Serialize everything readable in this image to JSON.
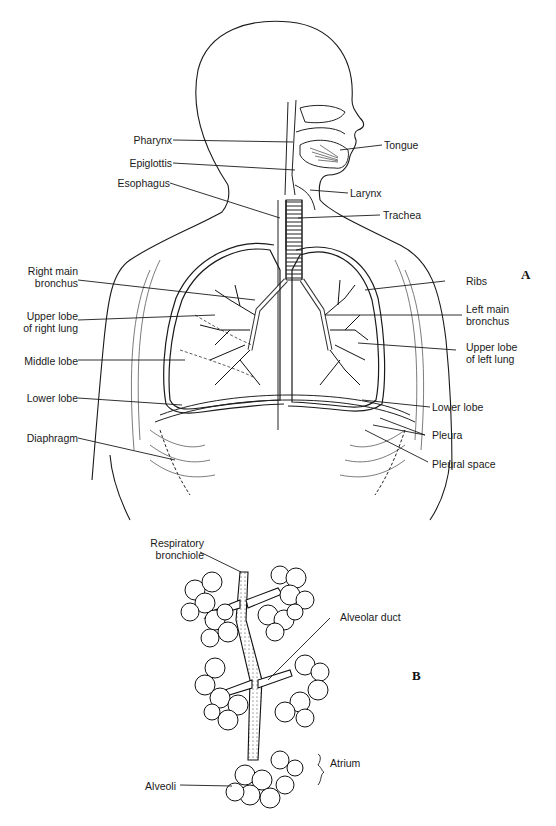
{
  "figure": {
    "panel_a": {
      "letter": "A",
      "labels_left": [
        {
          "id": "pharynx",
          "text": "Pharynx"
        },
        {
          "id": "epiglottis",
          "text": "Epiglottis"
        },
        {
          "id": "esophagus",
          "text": "Esophagus"
        },
        {
          "id": "right_main_bronchus_1",
          "text": "Right main"
        },
        {
          "id": "right_main_bronchus_2",
          "text": "bronchus"
        },
        {
          "id": "upper_lobe_right_1",
          "text": "Upper lobe"
        },
        {
          "id": "upper_lobe_right_2",
          "text": "of right lung"
        },
        {
          "id": "middle_lobe",
          "text": "Middle lobe"
        },
        {
          "id": "lower_lobe_right",
          "text": "Lower lobe"
        },
        {
          "id": "diaphragm",
          "text": "Diaphragm"
        }
      ],
      "labels_right": [
        {
          "id": "tongue",
          "text": "Tongue"
        },
        {
          "id": "larynx",
          "text": "Larynx"
        },
        {
          "id": "trachea",
          "text": "Trachea"
        },
        {
          "id": "ribs",
          "text": "Ribs"
        },
        {
          "id": "left_main_bronchus_1",
          "text": "Left main"
        },
        {
          "id": "left_main_bronchus_2",
          "text": "bronchus"
        },
        {
          "id": "upper_lobe_left_1",
          "text": "Upper lobe"
        },
        {
          "id": "upper_lobe_left_2",
          "text": "of left lung"
        },
        {
          "id": "lower_lobe_left",
          "text": "Lower lobe"
        },
        {
          "id": "pleura",
          "text": "Pleura"
        },
        {
          "id": "pleural_space",
          "text": "Pleural space"
        }
      ]
    },
    "panel_b": {
      "letter": "B",
      "labels": [
        {
          "id": "respiratory_bronchiole_1",
          "text": "Respiratory"
        },
        {
          "id": "respiratory_bronchiole_2",
          "text": "bronchiole"
        },
        {
          "id": "alveolar_duct",
          "text": "Alveolar duct"
        },
        {
          "id": "atrium",
          "text": "Atrium"
        },
        {
          "id": "alveoli",
          "text": "Alveoli"
        }
      ]
    }
  }
}
